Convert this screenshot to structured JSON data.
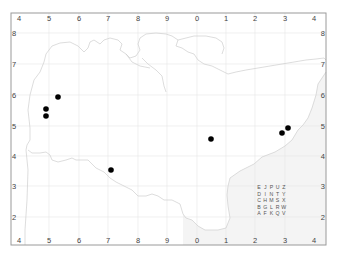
{
  "map": {
    "frame": {
      "left": 11,
      "top": 13,
      "right": 326,
      "bottom": 245
    },
    "colors": {
      "frame": "#9a9a9a",
      "grid": "#e6e6e6",
      "coast": "#d2d2d2",
      "sea": "#f4f4f4",
      "land": "#ffffff",
      "dot": "#000000",
      "label": "#444444"
    },
    "x_ticks": [
      {
        "label": "4",
        "x": 19
      },
      {
        "label": "5",
        "x": 49
      },
      {
        "label": "6",
        "x": 79
      },
      {
        "label": "7",
        "x": 108
      },
      {
        "label": "8",
        "x": 138
      },
      {
        "label": "9",
        "x": 167
      },
      {
        "label": "0",
        "x": 197
      },
      {
        "label": "1",
        "x": 226
      },
      {
        "label": "2",
        "x": 255
      },
      {
        "label": "3",
        "x": 285
      },
      {
        "label": "4",
        "x": 314
      }
    ],
    "y_ticks": [
      {
        "label": "8",
        "y": 33
      },
      {
        "label": "7",
        "y": 64
      },
      {
        "label": "6",
        "y": 95
      },
      {
        "label": "5",
        "y": 126
      },
      {
        "label": "4",
        "y": 156
      },
      {
        "label": "3",
        "y": 186
      },
      {
        "label": "2",
        "y": 217
      }
    ],
    "points": [
      {
        "x": 58,
        "y": 97
      },
      {
        "x": 46,
        "y": 109
      },
      {
        "x": 46,
        "y": 116
      },
      {
        "x": 111,
        "y": 170
      },
      {
        "x": 211,
        "y": 139
      },
      {
        "x": 288,
        "y": 128
      },
      {
        "x": 282,
        "y": 133
      }
    ],
    "letter_grid": {
      "rows": [
        [
          "E",
          "J",
          "P",
          "U",
          "Z"
        ],
        [
          "D",
          "I",
          "N",
          "T",
          "Y"
        ],
        [
          "C",
          "H",
          "M",
          "S",
          "X"
        ],
        [
          "B",
          "G",
          "L",
          "R",
          "W"
        ],
        [
          "A",
          "F",
          "K",
          "Q",
          "V"
        ]
      ]
    }
  }
}
